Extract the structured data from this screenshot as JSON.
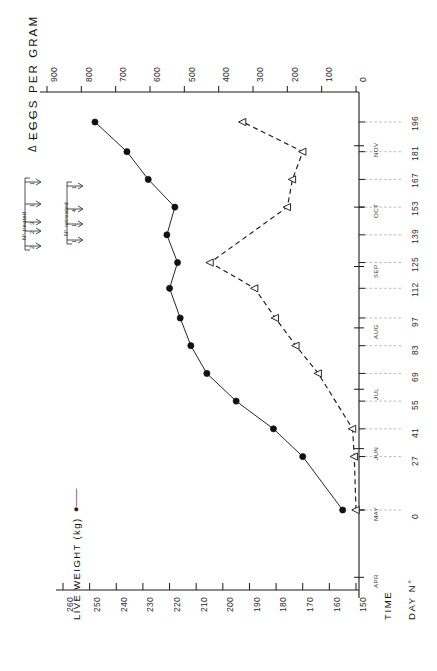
{
  "figure": {
    "orientation": "rotated-90-ccw",
    "background": "#ffffff",
    "ink_color": "#1a1a1a"
  },
  "legend": {
    "weight_label": "LIVE WEIGHT (kg)",
    "weight_marker": "filled-circle-solid-line",
    "eggs_label": "EGGS PER GRAM",
    "eggs_marker": "open-triangle-dashed-line",
    "eggs_dash_glyph": "Δ – – –"
  },
  "axes": {
    "time_axis_label": "TIME",
    "day_axis_label": "DAY N°",
    "weight_axis_title": "LIVE WEIGHT (kg)",
    "eggs_axis_title": "EGGS PER GRAM",
    "weight_ticks": [
      "260",
      "250",
      "240",
      "230",
      "220",
      "210",
      "200",
      "190",
      "180",
      "170",
      "160",
      "150"
    ],
    "eggs_ticks": [
      "900",
      "800",
      "700",
      "600",
      "500",
      "400",
      "300",
      "200",
      "100",
      "0"
    ],
    "day_ticks": [
      "0",
      "27",
      "41",
      "55",
      "69",
      "83",
      "97",
      "112",
      "125",
      "139",
      "153",
      "167",
      "181",
      "196"
    ],
    "months": [
      "APR",
      "MAY",
      "JUN",
      "JUL",
      "AUG",
      "SEP",
      "OCT",
      "NOV"
    ]
  },
  "annotations": {
    "treated": {
      "label": "N° treated",
      "counts": [
        "1",
        "1",
        "3",
        "2",
        "2"
      ]
    },
    "retreated": {
      "label": "N° retreated",
      "counts": [
        "1",
        "4",
        "1",
        "1"
      ]
    }
  },
  "chart_data": {
    "type": "line",
    "title": "",
    "subtitle": "",
    "xlabel": "DAY N° / TIME",
    "ylabel": "LIVE WEIGHT (kg)  |  EGGS PER GRAM",
    "grid": true,
    "legend_position": "outside-top-and-bottom",
    "x": [
      0,
      27,
      41,
      55,
      69,
      83,
      97,
      112,
      125,
      139,
      153,
      167,
      181,
      196
    ],
    "xticklabels": [
      "0",
      "27",
      "41",
      "55",
      "69",
      "83",
      "97",
      "112",
      "125",
      "139",
      "153",
      "167",
      "181",
      "196"
    ],
    "month_ticks": [
      "APR",
      "MAY",
      "JUN",
      "JUL",
      "AUG",
      "SEP",
      "OCT",
      "NOV"
    ],
    "series": [
      {
        "name": "LIVE WEIGHT (kg)",
        "marker": "filled-circle",
        "linestyle": "solid",
        "axis": "weight",
        "ylim": [
          150,
          265
        ],
        "ytick_values": [
          260,
          250,
          240,
          230,
          220,
          210,
          200,
          190,
          180,
          170,
          160,
          150
        ],
        "x": [
          0,
          27,
          41,
          55,
          69,
          83,
          97,
          112,
          125,
          139,
          153,
          167,
          181,
          196
        ],
        "values": [
          155,
          170,
          181,
          195,
          206,
          212,
          216,
          220,
          217,
          221,
          218,
          228,
          236,
          248
        ]
      },
      {
        "name": "EGGS PER GRAM",
        "marker": "open-triangle",
        "linestyle": "dashed",
        "axis": "eggs",
        "ylim": [
          0,
          950
        ],
        "ytick_values": [
          900,
          800,
          700,
          600,
          500,
          400,
          300,
          200,
          100,
          0
        ],
        "x": [
          0,
          27,
          41,
          69,
          83,
          97,
          112,
          125,
          153,
          167,
          181,
          196
        ],
        "values": [
          0,
          5,
          10,
          110,
          175,
          235,
          295,
          425,
          200,
          185,
          155,
          330
        ]
      }
    ]
  }
}
